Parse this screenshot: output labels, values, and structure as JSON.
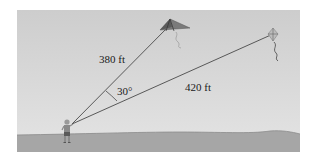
{
  "diagram": {
    "labels": {
      "string_a_length": "380 ft",
      "string_b_length": "420 ft",
      "angle": "30°"
    },
    "values": {
      "string_a_ft": 380,
      "string_b_ft": 420,
      "angle_deg": 30
    },
    "colors": {
      "sky_top": "#cdcdcd",
      "sky_bottom": "#e4e4e4",
      "ground": "#a6a6a6",
      "string": "#4a4a4a",
      "kite_a": "#6e6e6e",
      "text": "#1a1a1a"
    }
  }
}
